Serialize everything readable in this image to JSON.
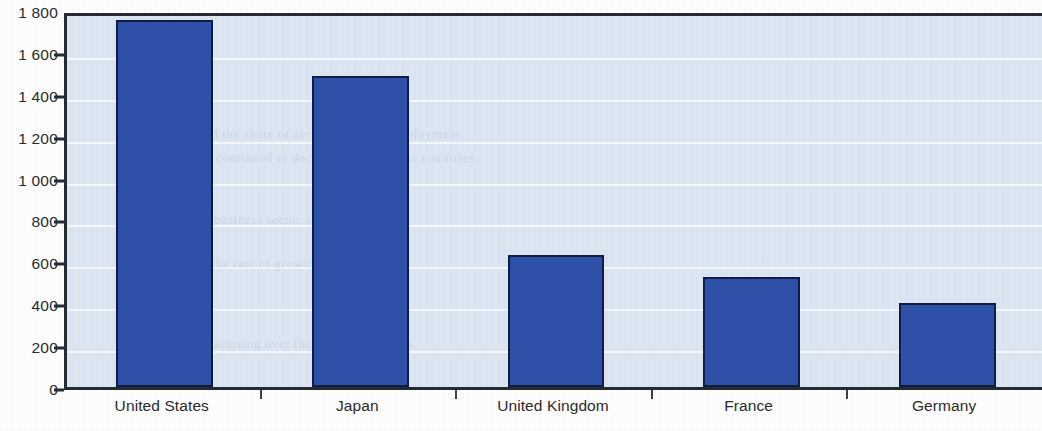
{
  "chart_data": {
    "type": "bar",
    "title": "",
    "subtitle": "",
    "xlabel": "",
    "ylabel": "",
    "categories": [
      "United States",
      "Japan",
      "United Kingdom",
      "France",
      "Germany"
    ],
    "values": [
      1750,
      1485,
      630,
      525,
      400
    ],
    "series": [
      {
        "name": "",
        "values": [
          1750,
          1485,
          630,
          525,
          400
        ]
      }
    ],
    "ylim": [
      0,
      1800
    ],
    "ytick_values": [
      0,
      200,
      400,
      600,
      800,
      1000,
      1200,
      1400,
      1600,
      1800
    ],
    "ytick_labels": [
      "0",
      "200",
      "400",
      "600",
      "800",
      "1 000",
      "1 200",
      "1 400",
      "1 600",
      "1 800"
    ],
    "grid": true,
    "grid_axis": "y",
    "legend": false,
    "legend_position": "none",
    "annotations": []
  },
  "style": {
    "bar_fill": "#2d51a8",
    "bar_stroke": "#101c42",
    "plot_background": "#dce6f2",
    "gridline_color": "#f4f8fc",
    "axis_color": "#262b33",
    "label_color": "#2b2b2b",
    "page_background": "#fdfdfd"
  },
  "bleedthrough": [
    {
      "text": "the same period the share of services in total employment",
      "x": 60,
      "y": 110
    },
    {
      "text": "industry has continued to decline in most of the countries",
      "x": 75,
      "y": 134
    },
    {
      "text": "in the business sector as a whole",
      "x": 110,
      "y": 196
    },
    {
      "text": "and the rate of growth of output per",
      "x": 120,
      "y": 240
    },
    {
      "text": "in manufacturing over the past two decades",
      "x": 95,
      "y": 320
    }
  ]
}
